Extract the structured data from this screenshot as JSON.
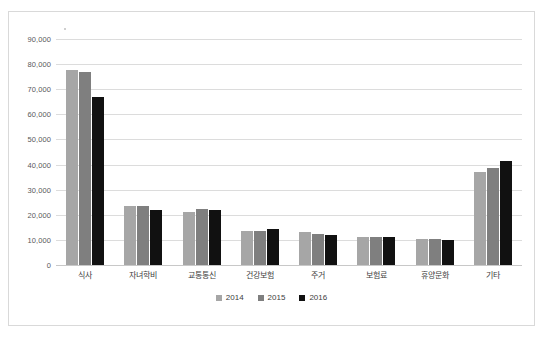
{
  "chart_data": {
    "type": "bar",
    "title": "",
    "subtitle": "",
    "xlabel": "",
    "ylabel": "",
    "ylim": [
      0,
      90000
    ],
    "ytick_step": 10000,
    "grid": true,
    "legend_position": "bottom",
    "categories": [
      "식사",
      "자녀학비",
      "교통통신",
      "건강보험",
      "주거",
      "보험료",
      "휴양문화",
      "기타"
    ],
    "ytick_labels": [
      "90,000",
      "80,000",
      "70,000",
      "60,000",
      "50,000",
      "40,000",
      "30,000",
      "20,000",
      "10,000",
      "0"
    ],
    "ytick_values": [
      90000,
      80000,
      70000,
      60000,
      50000,
      40000,
      30000,
      20000,
      10000,
      0
    ],
    "series": [
      {
        "name": "2014",
        "color": "#a6a6a6",
        "values": [
          77500,
          23500,
          21000,
          13500,
          13000,
          11000,
          10500,
          37000
        ]
      },
      {
        "name": "2015",
        "color": "#7f7f7f",
        "values": [
          77000,
          23500,
          22500,
          13500,
          12200,
          11200,
          10500,
          38500
        ]
      },
      {
        "name": "2016",
        "color": "#111111",
        "values": [
          67000,
          22000,
          21800,
          14500,
          11800,
          11000,
          9800,
          41500
        ]
      }
    ]
  }
}
